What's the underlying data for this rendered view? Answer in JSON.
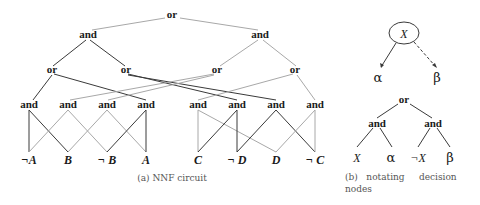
{
  "figure_a": {
    "caption": "(a)  NNF circuit",
    "root": "or",
    "level1": [
      "and",
      "and"
    ],
    "level2": [
      "or",
      "or",
      "or",
      "or"
    ],
    "level3": [
      "and",
      "and",
      "and",
      "and",
      "and",
      "and",
      "and",
      "and"
    ],
    "leaves": [
      "¬A",
      "B",
      "¬ B",
      "A",
      "C",
      "¬ D",
      "D",
      "¬ C"
    ]
  },
  "figure_b": {
    "caption_line1": "(b)   notating     decision",
    "caption_line2": "nodes",
    "decision_node": "X",
    "decision_high": "α",
    "decision_low": "β",
    "root": "or",
    "ands": [
      "and",
      "and"
    ],
    "leaves": [
      "X",
      "α",
      "¬X",
      "β"
    ]
  },
  "colors": {
    "dark_edge": "#3a3a3a",
    "light_edge": "#a8a8a8",
    "text": "#1a1a1a",
    "caption": "#555555"
  }
}
